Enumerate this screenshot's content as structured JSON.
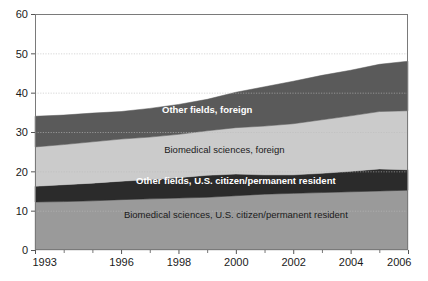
{
  "chart_data": {
    "type": "area",
    "stacked": true,
    "title": "",
    "subtitle": "",
    "xlabel": "",
    "ylabel": "",
    "xlim": [
      1993,
      2006
    ],
    "ylim": [
      0,
      60
    ],
    "ygrid": true,
    "xgrid": false,
    "legend_position": "inline-on-bands",
    "x": [
      1993,
      1994,
      1995,
      1996,
      1997,
      1998,
      1999,
      2000,
      2001,
      2002,
      2003,
      2004,
      2005,
      2006
    ],
    "ytick_labels": [
      "0",
      "10",
      "20",
      "30",
      "40",
      "50",
      "60"
    ],
    "ytick_values": [
      0,
      10,
      20,
      30,
      40,
      50,
      60
    ],
    "xtick_labels": [
      "1993",
      "1996",
      "1998",
      "2000",
      "2002",
      "2004",
      "2006"
    ],
    "xtick_values": [
      1993,
      1996,
      1998,
      2000,
      2002,
      2004,
      2006
    ],
    "xtick_minor_values": [
      1994,
      1995,
      1997,
      1999,
      2001,
      2003,
      2005
    ],
    "series": [
      {
        "name": "Biomedical sciences, U.S. citizen/permanent resident",
        "label": "Biomedical sciences, U.S. citizen/permanent resident",
        "color": "#9a9a9a",
        "label_color": "#1a1a1a",
        "label_bold": false,
        "label_x": 2000.0,
        "label_y": 9.0,
        "values": [
          12.2,
          12.3,
          12.5,
          12.8,
          13.0,
          13.2,
          13.4,
          13.8,
          14.2,
          14.4,
          14.6,
          14.8,
          15.0,
          15.2
        ]
      },
      {
        "name": "Other fields, U.S. citizen/permanent resident",
        "label": "Other fields, U.S. citizen/permanent resident",
        "color": "#2b2b2b",
        "label_color": "#ffffff",
        "label_bold": true,
        "label_x": 2000.0,
        "label_y": 17.6,
        "values": [
          4.0,
          4.3,
          4.5,
          4.7,
          4.9,
          5.2,
          5.6,
          5.5,
          4.9,
          4.7,
          4.9,
          5.2,
          5.6,
          5.2
        ]
      },
      {
        "name": "Biomedical sciences, foreign",
        "label": "Biomedical sciences, foreign",
        "color": "#cbcbcb",
        "label_color": "#1a1a1a",
        "label_bold": false,
        "label_x": 1999.6,
        "label_y": 25.5,
        "values": [
          10.0,
          10.2,
          10.5,
          10.7,
          10.8,
          11.0,
          11.3,
          11.8,
          12.4,
          13.0,
          13.6,
          14.1,
          14.6,
          15.0
        ]
      },
      {
        "name": "Other fields, foreign",
        "label": "Other fields, foreign",
        "color": "#5a5a5a",
        "label_color": "#ffffff",
        "label_bold": true,
        "label_x": 1999.0,
        "label_y": 35.6,
        "values": [
          7.8,
          7.5,
          7.3,
          7.0,
          7.3,
          7.6,
          8.0,
          9.0,
          10.0,
          10.8,
          11.3,
          11.6,
          12.0,
          12.6
        ]
      }
    ],
    "totals": [
      34.0,
      34.3,
      34.8,
      35.2,
      36.0,
      37.0,
      38.3,
      40.1,
      41.5,
      42.9,
      44.4,
      45.7,
      47.2,
      48.0
    ]
  },
  "axis": {
    "gridline_color": "#bdbdbd",
    "frame_color": "#7a7a7a",
    "tick_color": "#555555"
  },
  "plot_area": {
    "left": 35,
    "top": 14,
    "right": 408,
    "bottom": 250
  }
}
